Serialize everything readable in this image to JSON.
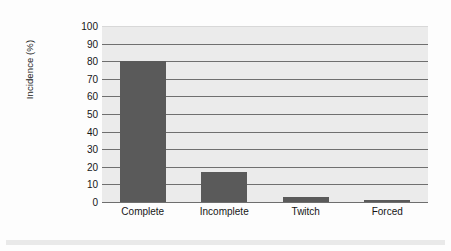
{
  "chart_data": {
    "type": "bar",
    "title": "",
    "xlabel": "",
    "ylabel": "Incidence (%)",
    "categories": [
      "Complete",
      "Incomplete",
      "Twitch",
      "Forced"
    ],
    "values": [
      80,
      17,
      3,
      1
    ],
    "ylim": [
      0,
      100
    ],
    "ytick_step": 10,
    "yticks": [
      100,
      90,
      80,
      70,
      60,
      50,
      40,
      30,
      20,
      10,
      0
    ],
    "ytick_labels": [
      "100",
      "90",
      "80",
      "70",
      "60",
      "50",
      "40",
      "30",
      "20",
      "10",
      "0"
    ],
    "grid": true,
    "grid_axis": "y",
    "legend": false,
    "legend_position": "none",
    "series": [
      {
        "name": "Incidence",
        "values": [
          80,
          17,
          3,
          1
        ]
      }
    ],
    "colors": {
      "bar_fill": "#5a5a5a",
      "plot_background": "#ebebeb",
      "gridline": "#6f6f6f",
      "axis_line": "#6e6e6e",
      "text": "#161616",
      "figure_background": "#fdfdfd",
      "bottom_strip": "#e9e9e9"
    }
  }
}
